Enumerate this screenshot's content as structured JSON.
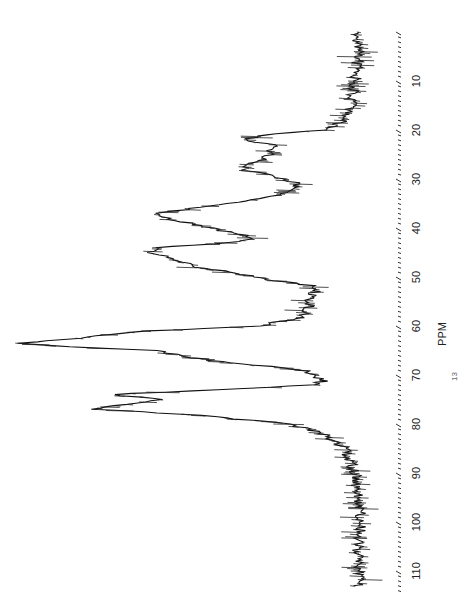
{
  "chart_data": {
    "type": "line",
    "title": "",
    "xlabel": "PPM",
    "ylabel": "",
    "orientation": "rotated-90",
    "xlim": [
      0,
      113
    ],
    "x_ticks": [
      10,
      20,
      30,
      40,
      50,
      60,
      70,
      80,
      90,
      100,
      110
    ],
    "grid": false,
    "series": [
      {
        "name": "spectrum",
        "x": [
          0,
          5,
          10,
          15,
          18,
          20,
          21,
          22,
          23,
          25,
          27,
          28,
          29,
          31,
          33,
          35,
          37,
          38,
          40,
          42,
          43,
          44,
          45,
          46,
          47,
          48,
          50,
          52,
          55,
          58,
          60,
          61,
          62,
          62.5,
          63,
          63.5,
          64,
          65,
          67,
          69,
          71,
          72,
          73,
          74,
          75,
          76,
          77,
          78,
          80,
          82,
          85,
          90,
          95,
          100,
          105,
          110,
          113
        ],
        "y": [
          0.02,
          0.02,
          0.03,
          0.04,
          0.06,
          0.12,
          0.3,
          0.36,
          0.27,
          0.28,
          0.33,
          0.36,
          0.3,
          0.19,
          0.24,
          0.4,
          0.6,
          0.58,
          0.45,
          0.32,
          0.4,
          0.6,
          0.62,
          0.56,
          0.54,
          0.48,
          0.32,
          0.14,
          0.16,
          0.18,
          0.3,
          0.62,
          0.8,
          0.84,
          0.94,
          1.0,
          0.92,
          0.62,
          0.45,
          0.18,
          0.12,
          0.14,
          0.44,
          0.74,
          0.6,
          0.7,
          0.8,
          0.52,
          0.22,
          0.12,
          0.06,
          0.03,
          0.02,
          0.01,
          0.02,
          0.02,
          0.02
        ]
      }
    ],
    "peaks_ppm": [
      22,
      28,
      37,
      44,
      47,
      62,
      63.5,
      74,
      77
    ]
  },
  "axis": {
    "title": "PPM",
    "tick_labels": [
      "10",
      "20",
      "30",
      "40",
      "50",
      "60",
      "70",
      "80",
      "90",
      "100",
      "110"
    ]
  },
  "annotation": "13"
}
